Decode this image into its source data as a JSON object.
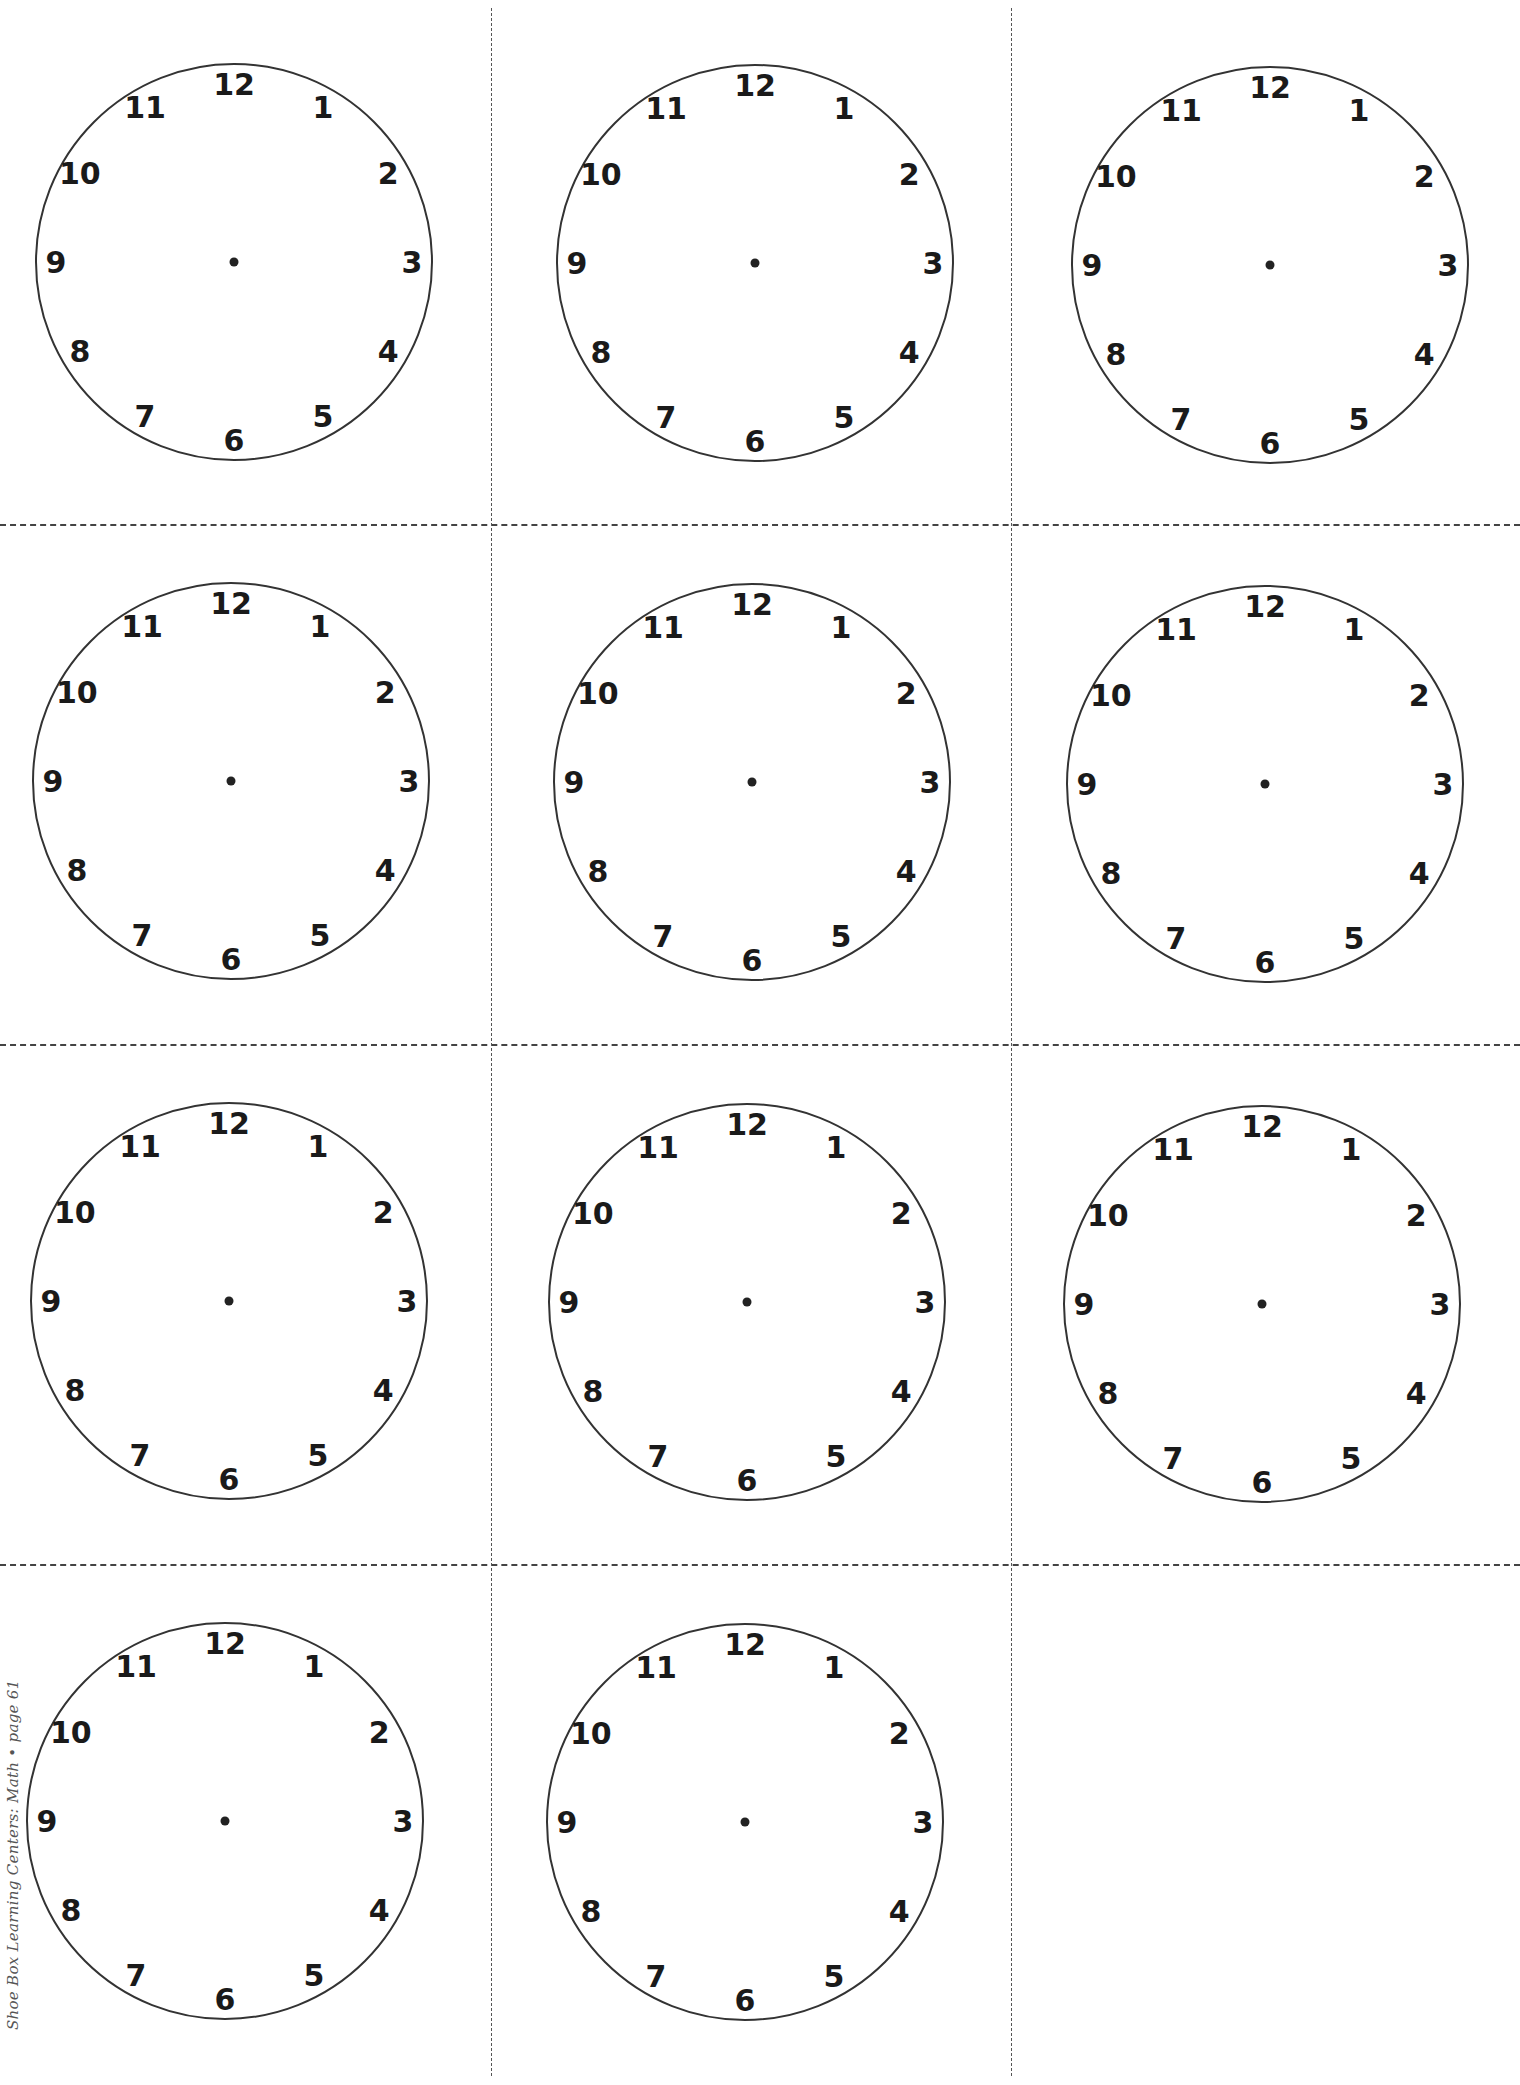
{
  "page": {
    "footer_text": "Shoe Box Learning Centers: Math • page 61"
  },
  "layout": {
    "horizontal_dividers": [
      {
        "y": 524,
        "x1": 0,
        "x2": 1520
      },
      {
        "y": 1044,
        "x1": 0,
        "x2": 1520
      },
      {
        "y": 1564,
        "x1": 0,
        "x2": 1520
      }
    ],
    "vertical_dividers": [
      {
        "x": 491,
        "y1": 8,
        "y2": 2076
      },
      {
        "x": 1011,
        "y1": 8,
        "y2": 2076
      }
    ]
  },
  "clock_face": {
    "radius": 198,
    "numeral_radius": 178,
    "numeral_size": 30,
    "center_dot_radius": 4.5,
    "stroke_color": "#333333",
    "numerals": [
      "12",
      "1",
      "2",
      "3",
      "4",
      "5",
      "6",
      "7",
      "8",
      "9",
      "10",
      "11"
    ]
  },
  "clocks": [
    {
      "row": 1,
      "col": 1,
      "cx": 234,
      "cy": 262
    },
    {
      "row": 1,
      "col": 2,
      "cx": 755,
      "cy": 263
    },
    {
      "row": 1,
      "col": 3,
      "cx": 1270,
      "cy": 265
    },
    {
      "row": 2,
      "col": 1,
      "cx": 231,
      "cy": 781
    },
    {
      "row": 2,
      "col": 2,
      "cx": 752,
      "cy": 782
    },
    {
      "row": 2,
      "col": 3,
      "cx": 1265,
      "cy": 784
    },
    {
      "row": 3,
      "col": 1,
      "cx": 229,
      "cy": 1301
    },
    {
      "row": 3,
      "col": 2,
      "cx": 747,
      "cy": 1302
    },
    {
      "row": 3,
      "col": 3,
      "cx": 1262,
      "cy": 1304
    },
    {
      "row": 4,
      "col": 1,
      "cx": 225,
      "cy": 1821
    },
    {
      "row": 4,
      "col": 2,
      "cx": 745,
      "cy": 1822
    }
  ]
}
